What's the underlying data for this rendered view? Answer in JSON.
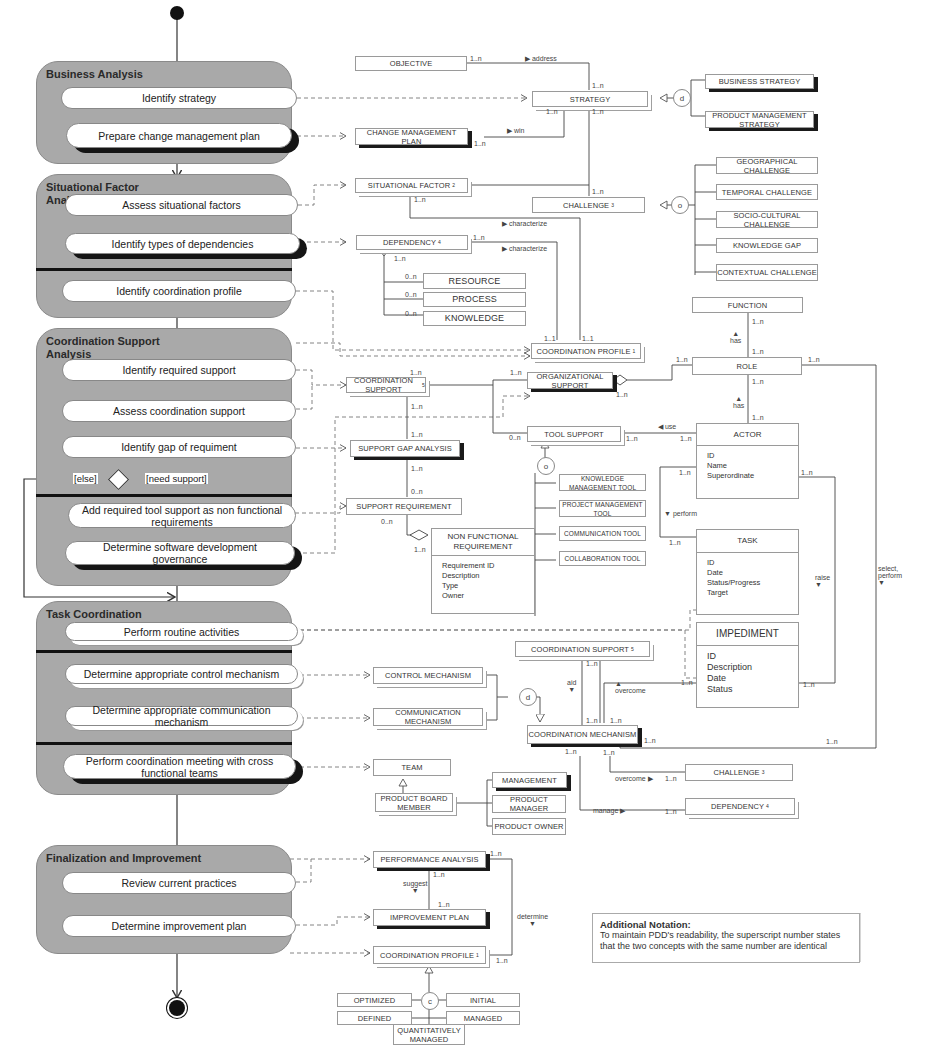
{
  "phases": [
    {
      "title": "Business Analysis",
      "activities": [
        "Identify strategy",
        "Prepare change management plan"
      ]
    },
    {
      "title": "Situational Factor Analysis",
      "activities": [
        "Assess situational factors",
        "Identify types of dependencies",
        "Identify coordination profile"
      ]
    },
    {
      "title": "Coordination Support Analysis",
      "activities": [
        "Identify required support",
        "Assess coordination support",
        "Identify gap of requiment",
        "Add required tool support as non functional requirements",
        "Determine software development governance"
      ],
      "decision": {
        "else_label": "[else]",
        "need_label": "[need support]"
      }
    },
    {
      "title": "Task Coordination",
      "activities": [
        "Perform routine activities",
        "Determine appropriate control mechanism",
        "Determine appropriate communication mechanism",
        "Perform coordination meeting with cross functional teams"
      ]
    },
    {
      "title": "Finalization and Improvement",
      "activities": [
        "Review current practices",
        "Determine improvement plan"
      ]
    }
  ],
  "concepts": {
    "objective": "OBJECTIVE",
    "strategy": "STRATEGY",
    "business_strategy": "BUSINESS STRATEGY",
    "product_management_strategy": "PRODUCT MANAGEMENT STRATEGY",
    "change_management_plan": "CHANGE MANAGEMENT PLAN",
    "situational_factor": "SITUATIONAL FACTOR",
    "situational_factor_sup": "2",
    "challenge": "CHALLENGE",
    "challenge_sup": "3",
    "geographical_challenge": "GEOGRAPHICAL CHALLENGE",
    "temporal_challenge": "TEMPORAL CHALLENGE",
    "socio_cultural_challenge": "SOCIO-CULTURAL CHALLENGE",
    "knowledge_gap": "KNOWLEDGE GAP",
    "contextual_challenge": "CONTEXTUAL CHALLENGE",
    "dependency": "DEPENDENCY",
    "dependency_sup": "4",
    "resource": "RESOURCE",
    "process": "PROCESS",
    "knowledge": "KNOWLEDGE",
    "coordination_profile": "COORDINATION PROFILE",
    "coordination_profile_sup": "1",
    "function": "FUNCTION",
    "role": "ROLE",
    "coordination_support": "COORDINATION SUPPORT",
    "coordination_support_sup": "5",
    "organizational_support": "ORGANIZATIONAL SUPPORT",
    "tool_support": "TOOL SUPPORT",
    "support_gap_analysis": "SUPPORT GAP ANALYSIS",
    "support_requirement": "SUPPORT REQUIREMENT",
    "knowledge_management_tool": "KNOWLEDGE MANAGEMENT TOOL",
    "project_management_tool": "PROJECT MANAGEMENT TOOL",
    "communication_tool": "COMMUNICATION TOOL",
    "collaboration_tool": "COLLABORATION TOOL",
    "control_mechanism": "CONTROL MECHANISM",
    "communication_mechanism": "COMMUNICATION MECHANISM",
    "coordination_mechanism": "COORDINATION MECHANISM",
    "team": "TEAM",
    "product_board_member": "PRODUCT BOARD MEMBER",
    "management": "MANAGEMENT",
    "product_manager": "PRODUCT MANAGER",
    "product_owner": "PRODUCT OWNER",
    "performance_analysis": "PERFORMANCE ANALYSIS",
    "improvement_plan": "IMPROVEMENT PLAN",
    "optimized": "OPTIMIZED",
    "initial": "INITIAL",
    "defined": "DEFINED",
    "managed": "MANAGED",
    "quantitatively_managed": "QUANTITATIVELY MANAGED"
  },
  "classes": {
    "actor": {
      "name": "ACTOR",
      "attributes": [
        "ID",
        "Name",
        "Superordinate"
      ]
    },
    "task": {
      "name": "TASK",
      "attributes": [
        "ID",
        "Date",
        "Status/Progress",
        "Target"
      ]
    },
    "impediment": {
      "name": "IMPEDIMENT",
      "attributes": [
        "ID",
        "Description",
        "Date",
        "Status"
      ]
    },
    "non_functional_requirement": {
      "name": "NON FUNCTIONAL REQUIREMENT",
      "attributes": [
        "Requirement ID",
        "Description",
        "Type",
        "Owner"
      ]
    }
  },
  "relations": {
    "address": "address",
    "win": "win",
    "characterize_1": "characterize",
    "characterize_2": "characterize",
    "has_1": "has",
    "has_2": "has",
    "use": "use",
    "perform": "perform",
    "raise": "raise",
    "select_perform": "select, perform",
    "aid": "aid",
    "overcome_1": "overcome",
    "overcome_2": "overcome",
    "manage": "manage",
    "suggest": "suggest",
    "determine": "determine"
  },
  "generalization_markers": {
    "strategy": "d",
    "challenge": "o",
    "tool_support": "o",
    "mechanism": "d",
    "profile": "c"
  },
  "multiplicity": {
    "one_n": "1..n",
    "zero_n": "0..n",
    "one_one": "1..1"
  },
  "note": {
    "title": "Additional Notation:",
    "body": "To maintain PDD's readability, the superscript number states that the two concepts with the same number are identical"
  }
}
